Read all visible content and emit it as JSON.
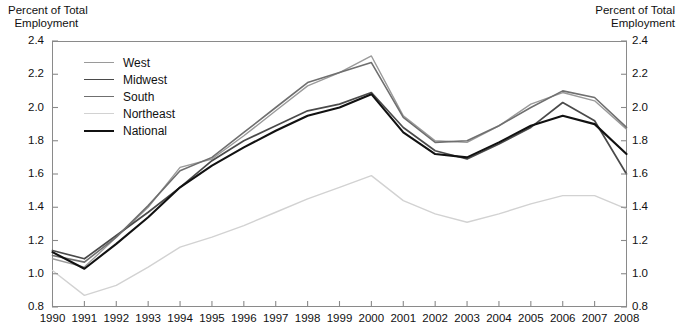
{
  "axis_titles": {
    "left": "Percent of Total\n  Employment",
    "right": "Percent of Total\nEmployment"
  },
  "legend": {
    "items": [
      {
        "label": "West",
        "color": "#9a9a9a",
        "width": 1.4
      },
      {
        "label": "Midwest",
        "color": "#4a4a4a",
        "width": 1.7
      },
      {
        "label": "South",
        "color": "#6f6f6f",
        "width": 1.6
      },
      {
        "label": "Northeast",
        "color": "#d2d2d2",
        "width": 1.4
      },
      {
        "label": "National",
        "color": "#111111",
        "width": 2.1
      }
    ]
  },
  "chart_data": {
    "type": "line",
    "title": "",
    "xlabel": "",
    "ylabel": "Percent of Total Employment",
    "ylim": [
      0.8,
      2.4
    ],
    "ytick_step": 0.2,
    "yticks": [
      "0.8",
      "1.0",
      "1.2",
      "1.4",
      "1.6",
      "1.8",
      "2.0",
      "2.2",
      "2.4"
    ],
    "grid": false,
    "legend_position": "upper-left-inside",
    "dual_y_axis": true,
    "categories": [
      1990,
      1991,
      1992,
      1993,
      1994,
      1995,
      1996,
      1997,
      1998,
      1999,
      2000,
      2001,
      2002,
      2003,
      2004,
      2005,
      2006,
      2007,
      2008
    ],
    "series": [
      {
        "name": "West",
        "color": "#9a9a9a",
        "values": [
          1.09,
          1.04,
          1.22,
          1.4,
          1.64,
          1.69,
          1.83,
          1.98,
          2.13,
          2.21,
          2.31,
          1.95,
          1.8,
          1.79,
          1.89,
          2.02,
          2.09,
          2.04,
          1.87
        ]
      },
      {
        "name": "Midwest",
        "color": "#4a4a4a",
        "values": [
          1.14,
          1.09,
          1.23,
          1.37,
          1.52,
          1.68,
          1.8,
          1.89,
          1.98,
          2.02,
          2.09,
          1.88,
          1.74,
          1.69,
          1.78,
          1.88,
          2.03,
          1.92,
          1.6
        ]
      },
      {
        "name": "South",
        "color": "#6f6f6f",
        "values": [
          1.11,
          1.07,
          1.22,
          1.41,
          1.62,
          1.7,
          1.85,
          2.0,
          2.15,
          2.21,
          2.27,
          1.94,
          1.79,
          1.8,
          1.89,
          2.0,
          2.1,
          2.06,
          1.88
        ]
      },
      {
        "name": "Northeast",
        "color": "#d2d2d2",
        "values": [
          1.02,
          0.87,
          0.93,
          1.04,
          1.16,
          1.22,
          1.29,
          1.37,
          1.45,
          1.52,
          1.59,
          1.44,
          1.36,
          1.31,
          1.36,
          1.42,
          1.47,
          1.47,
          1.39
        ]
      },
      {
        "name": "National",
        "color": "#111111",
        "values": [
          1.13,
          1.03,
          1.18,
          1.34,
          1.52,
          1.65,
          1.76,
          1.86,
          1.95,
          2.0,
          2.08,
          1.85,
          1.72,
          1.7,
          1.79,
          1.89,
          1.95,
          1.9,
          1.72
        ]
      }
    ]
  }
}
